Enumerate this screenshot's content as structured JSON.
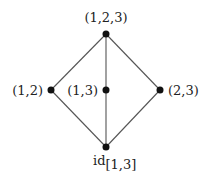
{
  "diagram": {
    "type": "hasse-diagram",
    "colors": {
      "edge": "#555555",
      "node": "#111111",
      "text": "#222222",
      "background": "#ffffff"
    },
    "nodes": [
      {
        "id": "top",
        "label": "(1,2,3)",
        "x": 106,
        "y": 34
      },
      {
        "id": "left",
        "label": "(1,2)",
        "x": 51,
        "y": 90
      },
      {
        "id": "middle",
        "label": "(1,3)",
        "x": 106,
        "y": 90
      },
      {
        "id": "right",
        "label": "(2,3)",
        "x": 160,
        "y": 90
      },
      {
        "id": "bottom",
        "label": "id",
        "label_subscript": "[1,3]",
        "x": 106,
        "y": 147
      }
    ],
    "edges": [
      {
        "from": "top",
        "to": "left"
      },
      {
        "from": "top",
        "to": "middle"
      },
      {
        "from": "top",
        "to": "right"
      },
      {
        "from": "left",
        "to": "bottom"
      },
      {
        "from": "middle",
        "to": "bottom"
      },
      {
        "from": "right",
        "to": "bottom"
      }
    ]
  }
}
